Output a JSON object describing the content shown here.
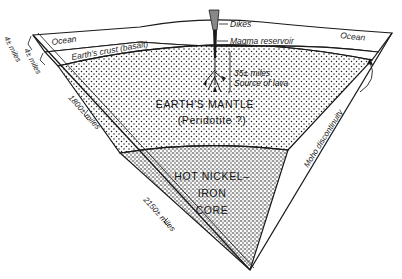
{
  "diagram": {
    "type": "cross-section wedge of Earth",
    "labels": {
      "ocean_left": "Ocean",
      "ocean_right": "Ocean",
      "crust": "Earth's crust (basalt)",
      "dikes": "Dikes",
      "magma_reservoir": "Magma reservoir",
      "lava_depth": "35± miles",
      "lava_source": "Source of lava",
      "mantle_line1": "EARTH'S MANTLE",
      "mantle_line2": "(Peridotite ?)",
      "core_line1": "HOT NICKEL–",
      "core_line2": "IRON",
      "core_line3": "CORE",
      "moho": "Moho discontinuity",
      "ocean_depth": "4± miles",
      "crust_depth": "4± miles",
      "mantle_depth": "1800± miles",
      "core_depth": "2150± miles"
    },
    "colors": {
      "ink": "#1a1a1a",
      "paper": "#ffffff"
    }
  }
}
